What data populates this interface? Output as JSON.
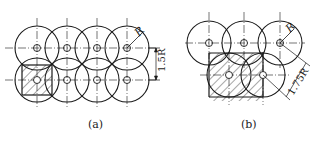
{
  "figure_a": {
    "caption": "(a)",
    "radius_label": "R",
    "spacing_label": "1.5R",
    "arrangement": "square grid 4x2",
    "centers": [
      [
        37,
        48
      ],
      [
        67,
        48
      ],
      [
        97,
        48
      ],
      [
        127,
        48
      ],
      [
        37,
        80
      ],
      [
        67,
        80
      ],
      [
        97,
        80
      ],
      [
        127,
        80
      ]
    ],
    "radius": 22
  },
  "figure_b": {
    "caption": "(b)",
    "radius_label": "R",
    "spacing_label": "1.75R",
    "arrangement": "staggered 3 over 2",
    "centers": [
      [
        209,
        43
      ],
      [
        244,
        43
      ],
      [
        280,
        43
      ],
      [
        229,
        75
      ],
      [
        263,
        75
      ]
    ],
    "radius": 22
  },
  "colors": {
    "line": "#1a1a1a",
    "background": "#ffffff"
  }
}
